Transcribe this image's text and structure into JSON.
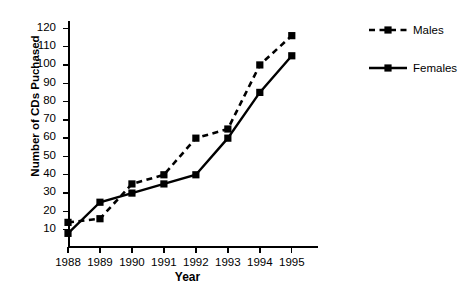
{
  "chart_data": {
    "type": "line",
    "title": "CD'S PURCHASED AT CITY MUSIC OUTLET",
    "xlabel": "Year",
    "ylabel": "Number of CDs Puchased",
    "categories": [
      "1988",
      "1989",
      "1990",
      "1991",
      "1992",
      "1993",
      "1994",
      "1995"
    ],
    "x": [
      1988,
      1989,
      1990,
      1991,
      1992,
      1993,
      1994,
      1995
    ],
    "series": [
      {
        "name": "Males",
        "values": [
          14,
          16,
          35,
          40,
          60,
          65,
          100,
          116
        ],
        "line_style": "dashed",
        "marker": "square",
        "color": "#000000"
      },
      {
        "name": "Females",
        "values": [
          8,
          25,
          30,
          35,
          40,
          60,
          85,
          105
        ],
        "line_style": "solid",
        "marker": "square",
        "color": "#000000"
      }
    ],
    "ylim": [
      0,
      124
    ],
    "yticks": [
      10,
      20,
      30,
      40,
      50,
      60,
      70,
      80,
      90,
      100,
      110,
      120
    ],
    "ytick_labels": [
      "10",
      "20",
      "30",
      "40",
      "50",
      "60",
      "70",
      "80",
      "90",
      "100",
      "110",
      "120"
    ],
    "grid": false,
    "legend_position": "right",
    "legend_entries": [
      "Males",
      "Females"
    ]
  }
}
